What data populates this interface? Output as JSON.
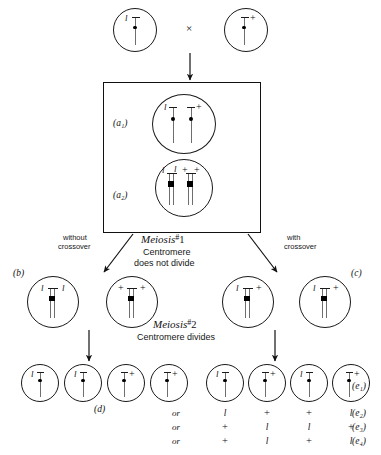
{
  "figure": {
    "colors": {
      "ink": "#111111",
      "rod": "#6e6e6e",
      "centromere": "#000000"
    }
  },
  "parents": {
    "left": {
      "label": "(parent-l)",
      "alleles": [
        "l"
      ]
    },
    "right": {
      "label": "(parent-plus)",
      "alleles": [
        "+"
      ]
    },
    "cross_symbol": "×"
  },
  "box": {
    "stages": [
      {
        "key": "a1",
        "label": "(a₁)",
        "alleles": [
          "l",
          "+"
        ],
        "note": "unreplicated homologs"
      },
      {
        "key": "a2",
        "label": "(a₂)",
        "alleles": [
          "l",
          "l",
          "+",
          "+"
        ],
        "note": "replicated, sister chromatids"
      }
    ]
  },
  "meiosis1": {
    "title_italic": "Meiosis",
    "title_hash": "#",
    "title_num": "1",
    "caption_line1": "Centromere",
    "caption_line2": "does not divide",
    "left_branch_line1": "without",
    "left_branch_line2": "crossover",
    "right_branch_line1": "with",
    "right_branch_line2": "crossover"
  },
  "meiosis2": {
    "title_italic": "Meiosis",
    "title_hash": "#",
    "title_num": "2",
    "caption": "Centromere divides"
  },
  "row_b_c": {
    "label_b": "(b)",
    "label_c": "(c)",
    "cells": [
      {
        "left": "l",
        "right": "l"
      },
      {
        "left": "+",
        "right": "+"
      },
      {
        "left": "l",
        "right": "+"
      },
      {
        "left": "l",
        "right": "+"
      }
    ]
  },
  "row_d": {
    "label": "(d)",
    "cells": [
      {
        "allele": "l",
        "side": "left"
      },
      {
        "allele": "l",
        "side": "left"
      },
      {
        "allele": "+",
        "side": "right"
      },
      {
        "allele": "+",
        "side": "right"
      }
    ]
  },
  "row_e": {
    "label_e1": "(e₁)",
    "cells": [
      {
        "allele": "l",
        "side": "left"
      },
      {
        "allele": "+",
        "side": "right"
      },
      {
        "allele": "l",
        "side": "left"
      },
      {
        "allele": "+",
        "side": "right"
      }
    ],
    "alternatives": [
      {
        "or": "or",
        "values": [
          "l",
          "+",
          "+",
          "l"
        ],
        "label": "(e₂)"
      },
      {
        "or": "or",
        "values": [
          "+",
          "l",
          "l",
          "+"
        ],
        "label": "(e₃)"
      },
      {
        "or": "or",
        "values": [
          "+",
          "l",
          "+",
          "l"
        ],
        "label": "(e₄)"
      }
    ]
  }
}
